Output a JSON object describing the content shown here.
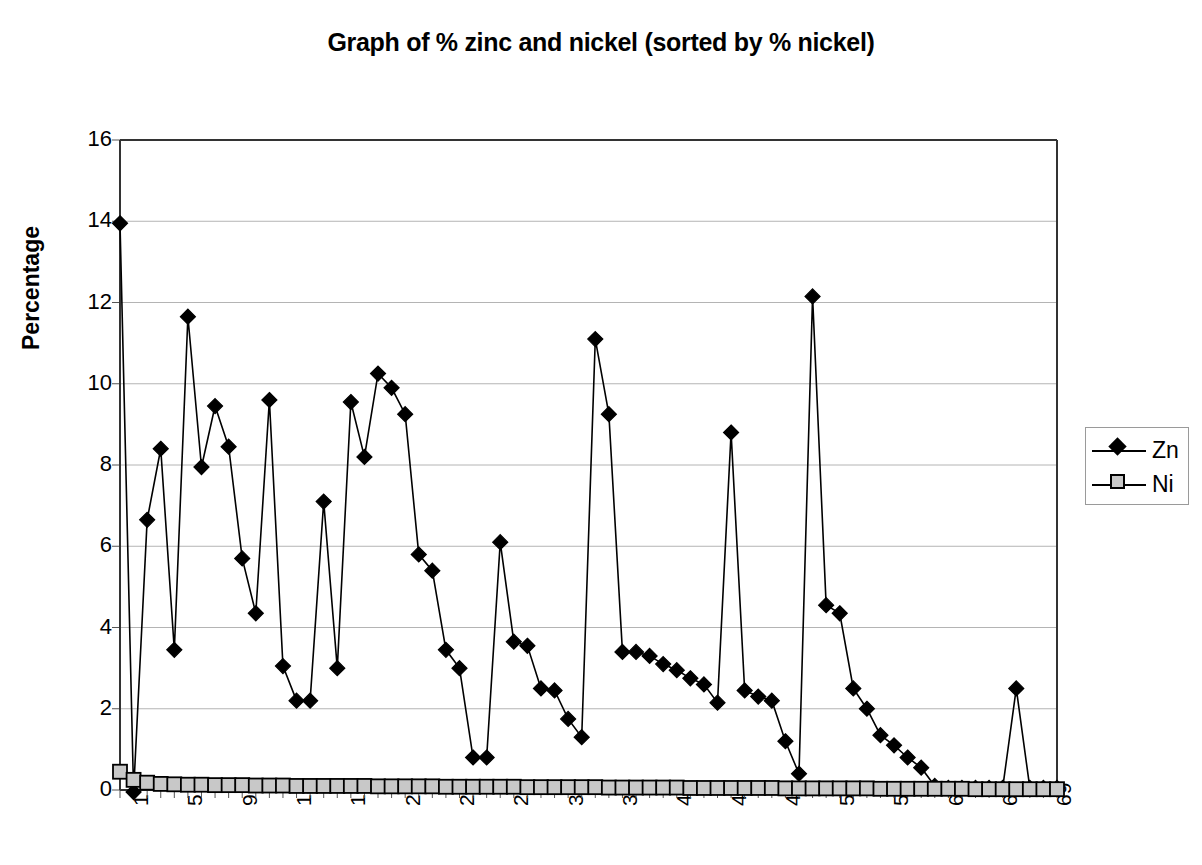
{
  "chart_data": {
    "type": "line",
    "title": "Graph of % zinc and nickel (sorted by % nickel)",
    "xlabel": "",
    "ylabel": "Percentage",
    "ylim": [
      0,
      16
    ],
    "xlim": [
      1,
      70
    ],
    "y_ticks": [
      0,
      2,
      4,
      6,
      8,
      10,
      12,
      14,
      16
    ],
    "x_ticks": [
      1,
      5,
      9,
      13,
      17,
      21,
      25,
      29,
      33,
      37,
      41,
      45,
      49,
      53,
      57,
      61,
      65,
      69
    ],
    "grid": "horizontal",
    "legend_position": "right",
    "x": [
      1,
      2,
      3,
      4,
      5,
      6,
      7,
      8,
      9,
      10,
      11,
      12,
      13,
      14,
      15,
      16,
      17,
      18,
      19,
      20,
      21,
      22,
      23,
      24,
      25,
      26,
      27,
      28,
      29,
      30,
      31,
      32,
      33,
      34,
      35,
      36,
      37,
      38,
      39,
      40,
      41,
      42,
      43,
      44,
      45,
      46,
      47,
      48,
      49,
      50,
      51,
      52,
      53,
      54,
      55,
      56,
      57,
      58,
      59,
      60,
      61,
      62,
      63,
      64,
      65,
      66,
      67,
      68,
      69,
      70
    ],
    "series": [
      {
        "name": "Zn",
        "color": "#000000",
        "marker": "diamond",
        "values": [
          13.95,
          -0.05,
          6.65,
          8.4,
          3.45,
          11.65,
          7.95,
          9.45,
          8.45,
          5.7,
          4.35,
          9.6,
          3.05,
          2.2,
          2.2,
          7.1,
          3.0,
          9.55,
          8.2,
          10.25,
          9.9,
          9.25,
          5.8,
          5.4,
          3.45,
          3.0,
          0.8,
          0.8,
          6.1,
          3.65,
          3.55,
          2.5,
          2.45,
          1.75,
          1.3,
          11.1,
          9.25,
          3.4,
          3.4,
          3.3,
          3.1,
          2.95,
          2.75,
          2.6,
          2.15,
          8.8,
          2.45,
          2.3,
          2.2,
          1.2,
          0.4,
          12.15,
          4.55,
          4.35,
          2.5,
          2.0,
          1.35,
          1.1,
          0.8,
          0.55,
          0.1,
          0.05,
          0.05,
          0.05,
          0.05,
          0.05,
          2.5,
          0.05,
          0.05,
          0.05
        ]
      },
      {
        "name": "Ni",
        "color": "#c8c8c8",
        "marker": "square",
        "values": [
          0.45,
          0.25,
          0.18,
          0.15,
          0.14,
          0.13,
          0.13,
          0.12,
          0.12,
          0.12,
          0.11,
          0.11,
          0.11,
          0.1,
          0.1,
          0.1,
          0.1,
          0.1,
          0.1,
          0.09,
          0.09,
          0.09,
          0.09,
          0.09,
          0.08,
          0.08,
          0.08,
          0.08,
          0.08,
          0.08,
          0.07,
          0.07,
          0.07,
          0.07,
          0.07,
          0.07,
          0.06,
          0.06,
          0.06,
          0.06,
          0.06,
          0.06,
          0.05,
          0.05,
          0.05,
          0.05,
          0.05,
          0.05,
          0.05,
          0.04,
          0.04,
          0.04,
          0.04,
          0.04,
          0.04,
          0.04,
          0.03,
          0.03,
          0.03,
          0.03,
          0.03,
          0.03,
          0.03,
          0.02,
          0.02,
          0.02,
          0.02,
          0.02,
          0.02,
          0.02
        ]
      }
    ],
    "legend": [
      {
        "label": "Zn",
        "marker": "diamond",
        "color": "#000000"
      },
      {
        "label": "Ni",
        "marker": "square",
        "color": "#c8c8c8"
      }
    ]
  }
}
